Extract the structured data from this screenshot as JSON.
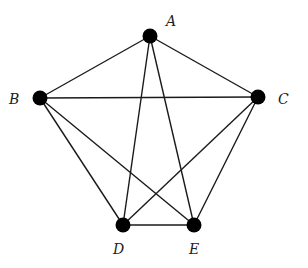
{
  "diagram": {
    "type": "graph",
    "name": "complete graph K5",
    "node_color": "#000000",
    "edge_color": "#1a1a1a",
    "nodes": [
      {
        "id": "A",
        "label": "A",
        "x": 150,
        "y": 36,
        "label_x": 166,
        "label_y": 26
      },
      {
        "id": "B",
        "label": "B",
        "x": 40,
        "y": 98,
        "label_x": 9,
        "label_y": 104
      },
      {
        "id": "C",
        "label": "C",
        "x": 258,
        "y": 97,
        "label_x": 278,
        "label_y": 104
      },
      {
        "id": "D",
        "label": "D",
        "x": 123,
        "y": 225,
        "label_x": 113,
        "label_y": 254
      },
      {
        "id": "E",
        "label": "E",
        "x": 194,
        "y": 225,
        "label_x": 189,
        "label_y": 254
      }
    ],
    "edges": [
      [
        "A",
        "B"
      ],
      [
        "A",
        "C"
      ],
      [
        "A",
        "D"
      ],
      [
        "A",
        "E"
      ],
      [
        "B",
        "C"
      ],
      [
        "B",
        "D"
      ],
      [
        "B",
        "E"
      ],
      [
        "C",
        "D"
      ],
      [
        "C",
        "E"
      ],
      [
        "D",
        "E"
      ]
    ]
  }
}
